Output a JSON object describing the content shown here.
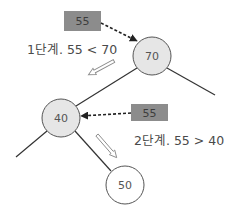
{
  "diagram": {
    "type": "binary-search-tree-insertion",
    "colors": {
      "edge": "#333333",
      "node_fill_visited": "#e6e6e6",
      "node_fill_new": "#ffffff",
      "node_stroke": "#555555",
      "node_text": "#555555",
      "key_box_fill": "#8c8c8c",
      "key_box_text": "#3d3d3d",
      "step_text": "#4a4a4a"
    },
    "nodes": [
      {
        "id": "n70",
        "label": "70",
        "cx": 152,
        "cy": 56,
        "r": 19,
        "fill": "visited"
      },
      {
        "id": "n40",
        "label": "40",
        "cx": 61,
        "cy": 118,
        "r": 19,
        "fill": "visited"
      },
      {
        "id": "n50",
        "label": "50",
        "cx": 125,
        "cy": 185,
        "r": 19,
        "fill": "new"
      }
    ],
    "edges": [
      {
        "from": "n70",
        "to": "n40"
      },
      {
        "from": "n70",
        "to": "right-offscreen"
      },
      {
        "from": "n40",
        "to": "left-offscreen"
      },
      {
        "from": "n40",
        "to": "n50"
      }
    ],
    "key_boxes": [
      {
        "id": "key1",
        "label": "55",
        "x": 64,
        "y": 11,
        "w": 37,
        "h": 20
      },
      {
        "id": "key2",
        "label": "55",
        "x": 131,
        "y": 104,
        "w": 37,
        "h": 17
      }
    ],
    "steps": [
      {
        "id": "step1",
        "label": "1단계. 55 < 70",
        "x": 27,
        "y": 54
      },
      {
        "id": "step2",
        "label": "2단계. 55 > 40",
        "x": 134,
        "y": 145
      }
    ],
    "direction_arrows": [
      {
        "id": "arrow1",
        "direction": "down-left",
        "from": [
          114,
          61
        ],
        "to": [
          88,
          75
        ]
      },
      {
        "id": "arrow2",
        "direction": "down-right",
        "from": [
          97,
          135
        ],
        "to": [
          117,
          157
        ]
      }
    ]
  }
}
